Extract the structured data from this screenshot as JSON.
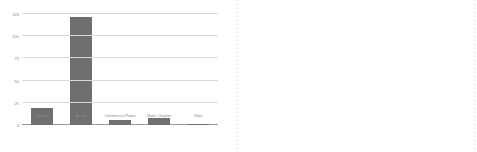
{
  "chart_data": [
    {
      "type": "bar",
      "title": "",
      "xlabel": "",
      "ylabel": "",
      "ylim": [
        0,
        125
      ],
      "yticks": [
        0,
        25,
        50,
        75,
        100,
        125
      ],
      "ytick_labels": [
        "0",
        "25",
        "50",
        "75",
        "100",
        "125"
      ],
      "grid": true,
      "legend": "none",
      "categories": [
        "Review",
        "Article",
        "Conference Paper",
        "Book Chapter",
        "Note"
      ],
      "values": [
        19,
        122,
        6,
        8,
        1
      ],
      "bar_color": "#6f6f6f",
      "grid_color": "#d9d9d9",
      "tick_color": "#8c8c8c"
    },
    {
      "type": "bar",
      "title": "",
      "xlabel": "",
      "ylabel": "",
      "ylim": [
        0,
        25
      ],
      "yticks": [
        0,
        5,
        10,
        15,
        20,
        25
      ],
      "ytick_labels": [
        "0",
        "5",
        "10",
        "15",
        "20",
        "25"
      ],
      "grid": true,
      "legend": "none",
      "categories": [
        "2006",
        "2007",
        "2008",
        "2009",
        "2010",
        "2011",
        "2012",
        "2013",
        "2014",
        "2015",
        "2016",
        "2017",
        "2018",
        "2019",
        "2020",
        "2021"
      ],
      "values": [
        1,
        1,
        2,
        3,
        3,
        6,
        5,
        6,
        21,
        17,
        20,
        16,
        18,
        18,
        18,
        7
      ],
      "series": [
        {
          "name": "Documents",
          "type": "bar",
          "values": [
            1,
            1,
            2,
            3,
            3,
            6,
            5,
            6,
            21,
            17,
            20,
            16,
            18,
            18,
            18,
            7
          ]
        },
        {
          "name": "Trend",
          "type": "line",
          "values": [
            4.0,
            4.3,
            4.7,
            5.2,
            5.8,
            6.6,
            7.5,
            8.7,
            10.2,
            12.0,
            14.2,
            16.8,
            19.6,
            22.2,
            24.2,
            25.4
          ]
        }
      ],
      "bar_color": "#6f6f6f",
      "line_color": "#9b9b9b",
      "grid_color": "#d9d9d9",
      "tick_color": "#8c8c8c"
    }
  ]
}
